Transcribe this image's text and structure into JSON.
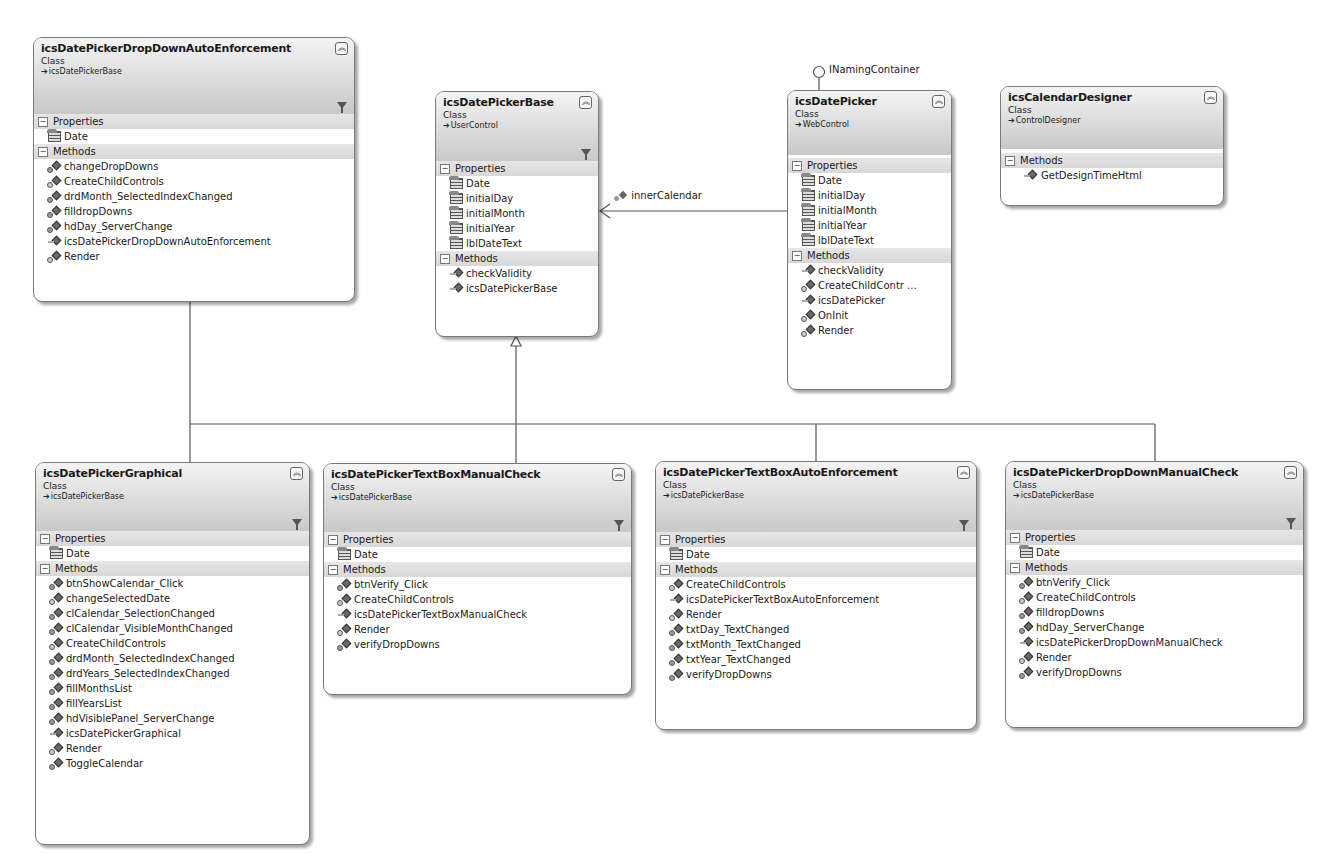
{
  "diagram": {
    "type": "class-diagram",
    "classes": [
      {
        "id": "A",
        "name": "icsDatePickerDropDownAutoEnforcement",
        "kind": "Class",
        "base": "icsDatePickerBase",
        "properties_label": "Properties",
        "methods_label": "Methods",
        "properties": [
          "Date"
        ],
        "methods": [
          {
            "name": "changeDropDowns",
            "access": "protected"
          },
          {
            "name": "CreateChildControls",
            "access": "override"
          },
          {
            "name": "drdMonth_SelectedIndexChanged",
            "access": "protected"
          },
          {
            "name": "filldropDowns",
            "access": "protected"
          },
          {
            "name": "hdDay_ServerChange",
            "access": "protected"
          },
          {
            "name": "icsDatePickerDropDownAutoEnforcement",
            "access": "public"
          },
          {
            "name": "Render",
            "access": "override"
          }
        ]
      },
      {
        "id": "B",
        "name": "icsDatePickerBase",
        "kind": "Class",
        "base": "UserControl",
        "properties_label": "Properties",
        "methods_label": "Methods",
        "properties": [
          "Date",
          "initialDay",
          "initialMonth",
          "initialYear",
          "lblDateText"
        ],
        "methods": [
          {
            "name": "checkValidity",
            "access": "public"
          },
          {
            "name": "icsDatePickerBase",
            "access": "public"
          }
        ]
      },
      {
        "id": "C",
        "name": "icsDatePicker",
        "kind": "Class",
        "base": "WebControl",
        "interface": "INamingContainer",
        "properties_label": "Properties",
        "methods_label": "Methods",
        "properties": [
          "Date",
          "initialDay",
          "initialMonth",
          "initialYear",
          "lblDateText"
        ],
        "methods": [
          {
            "name": "checkValidity",
            "access": "public"
          },
          {
            "name": "CreateChildContr ...",
            "access": "override"
          },
          {
            "name": "icsDatePicker",
            "access": "public"
          },
          {
            "name": "OnInit",
            "access": "override"
          },
          {
            "name": "Render",
            "access": "override"
          }
        ]
      },
      {
        "id": "D",
        "name": "icsCalendarDesigner",
        "kind": "Class",
        "base": "ControlDesigner",
        "methods_label": "Methods",
        "properties": [],
        "methods": [
          {
            "name": "GetDesignTimeHtml",
            "access": "public"
          }
        ]
      },
      {
        "id": "E",
        "name": "icsDatePickerGraphical",
        "kind": "Class",
        "base": "icsDatePickerBase",
        "properties_label": "Properties",
        "methods_label": "Methods",
        "properties": [
          "Date"
        ],
        "methods": [
          {
            "name": "btnShowCalendar_Click",
            "access": "protected"
          },
          {
            "name": "changeSelectedDate",
            "access": "override"
          },
          {
            "name": "clCalendar_SelectionChanged",
            "access": "protected"
          },
          {
            "name": "clCalendar_VisibleMonthChanged",
            "access": "protected"
          },
          {
            "name": "CreateChildControls",
            "access": "override"
          },
          {
            "name": "drdMonth_SelectedIndexChanged",
            "access": "protected"
          },
          {
            "name": "drdYears_SelectedIndexChanged",
            "access": "protected"
          },
          {
            "name": "fillMonthsList",
            "access": "protected"
          },
          {
            "name": "fillYearsList",
            "access": "protected"
          },
          {
            "name": "hdVisiblePanel_ServerChange",
            "access": "protected"
          },
          {
            "name": "icsDatePickerGraphical",
            "access": "public"
          },
          {
            "name": "Render",
            "access": "override"
          },
          {
            "name": "ToggleCalendar",
            "access": "protected"
          }
        ]
      },
      {
        "id": "F",
        "name": "icsDatePickerTextBoxManualCheck",
        "kind": "Class",
        "base": "icsDatePickerBase",
        "properties_label": "Properties",
        "methods_label": "Methods",
        "properties": [
          "Date"
        ],
        "methods": [
          {
            "name": "btnVerify_Click",
            "access": "protected"
          },
          {
            "name": "CreateChildControls",
            "access": "override"
          },
          {
            "name": "icsDatePickerTextBoxManualCheck",
            "access": "public"
          },
          {
            "name": "Render",
            "access": "override"
          },
          {
            "name": "verifyDropDowns",
            "access": "protected"
          }
        ]
      },
      {
        "id": "G",
        "name": "icsDatePickerTextBoxAutoEnforcement",
        "kind": "Class",
        "base": "icsDatePickerBase",
        "properties_label": "Properties",
        "methods_label": "Methods",
        "properties": [
          "Date"
        ],
        "methods": [
          {
            "name": "CreateChildControls",
            "access": "override"
          },
          {
            "name": "icsDatePickerTextBoxAutoEnforcement",
            "access": "public"
          },
          {
            "name": "Render",
            "access": "override"
          },
          {
            "name": "txtDay_TextChanged",
            "access": "protected"
          },
          {
            "name": "txtMonth_TextChanged",
            "access": "protected"
          },
          {
            "name": "txtYear_TextChanged",
            "access": "protected"
          },
          {
            "name": "verifyDropDowns",
            "access": "protected"
          }
        ]
      },
      {
        "id": "H",
        "name": "icsDatePickerDropDownManualCheck",
        "kind": "Class",
        "base": "icsDatePickerBase",
        "properties_label": "Properties",
        "methods_label": "Methods",
        "properties": [
          "Date"
        ],
        "methods": [
          {
            "name": "btnVerify_Click",
            "access": "protected"
          },
          {
            "name": "CreateChildControls",
            "access": "override"
          },
          {
            "name": "filldropDowns",
            "access": "protected"
          },
          {
            "name": "hdDay_ServerChange",
            "access": "protected"
          },
          {
            "name": "icsDatePickerDropDownManualCheck",
            "access": "public"
          },
          {
            "name": "Render",
            "access": "override"
          },
          {
            "name": "verifyDropDowns",
            "access": "protected"
          }
        ]
      }
    ],
    "associations": [
      {
        "from": "icsDatePicker",
        "to": "icsDatePickerBase",
        "label": "innerCalendar"
      }
    ],
    "inheritance": {
      "parent": "icsDatePickerBase",
      "children": [
        "icsDatePickerDropDownAutoEnforcement",
        "icsDatePickerGraphical",
        "icsDatePickerTextBoxManualCheck",
        "icsDatePickerTextBoxAutoEnforcement",
        "icsDatePickerDropDownManualCheck"
      ]
    },
    "interface_lollipop": "INamingContainer"
  }
}
